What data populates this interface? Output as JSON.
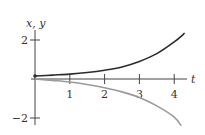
{
  "chart_data": {
    "type": "line",
    "title": "",
    "xlabel": "t",
    "ylabel": "x, y",
    "xlim": [
      0,
      4.4
    ],
    "ylim": [
      -2.4,
      2.6
    ],
    "x_ticks": [
      1,
      2,
      3,
      4
    ],
    "x_tick_labels": [
      "1",
      "2",
      "3",
      "4"
    ],
    "y_ticks": [
      2,
      -2
    ],
    "y_tick_labels": [
      "2",
      "−2"
    ],
    "grid": false,
    "legend": null,
    "series": [
      {
        "name": "x",
        "color": "#2b2b2b",
        "start_marker": true,
        "x": [
          0,
          0.5,
          1,
          1.5,
          2,
          2.5,
          3,
          3.5,
          4,
          4.3
        ],
        "values": [
          0.15,
          0.2,
          0.25,
          0.33,
          0.45,
          0.62,
          0.9,
          1.3,
          1.9,
          2.35
        ]
      },
      {
        "name": "y",
        "color": "#9a9a9a",
        "start_marker": false,
        "x": [
          0,
          0.5,
          1,
          1.5,
          2,
          2.5,
          3,
          3.5,
          4,
          4.2
        ],
        "values": [
          0,
          -0.07,
          -0.15,
          -0.28,
          -0.45,
          -0.66,
          -0.95,
          -1.38,
          -1.95,
          -2.4
        ]
      }
    ]
  },
  "axes": {
    "t_label": "t",
    "xy_label": "x, y"
  }
}
